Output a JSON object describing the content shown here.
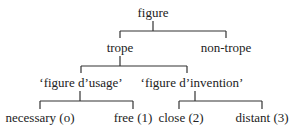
{
  "diagram": {
    "type": "tree",
    "nodes": {
      "root": {
        "label": "figure"
      },
      "trope": {
        "label": "trope"
      },
      "non_trope": {
        "label": "non-trope"
      },
      "usage": {
        "label": "‘figure d’usage’"
      },
      "invention": {
        "label": "‘figure d’invention’"
      },
      "necessary": {
        "label": "necessary (o)"
      },
      "free": {
        "label": "free (1)"
      },
      "close": {
        "label": "close (2)"
      },
      "distant": {
        "label": "distant (3)"
      }
    },
    "edges": [
      [
        "figure",
        "trope"
      ],
      [
        "figure",
        "non-trope"
      ],
      [
        "trope",
        "‘figure d’usage’"
      ],
      [
        "trope",
        "‘figure d’invention’"
      ],
      [
        "‘figure d’usage’",
        "necessary (o)"
      ],
      [
        "‘figure d’usage’",
        "free (1)"
      ],
      [
        "‘figure d’invention’",
        "close (2)"
      ],
      [
        "‘figure d’invention’",
        "distant (3)"
      ]
    ],
    "line_color": "#333333",
    "text_color": "#222222"
  }
}
